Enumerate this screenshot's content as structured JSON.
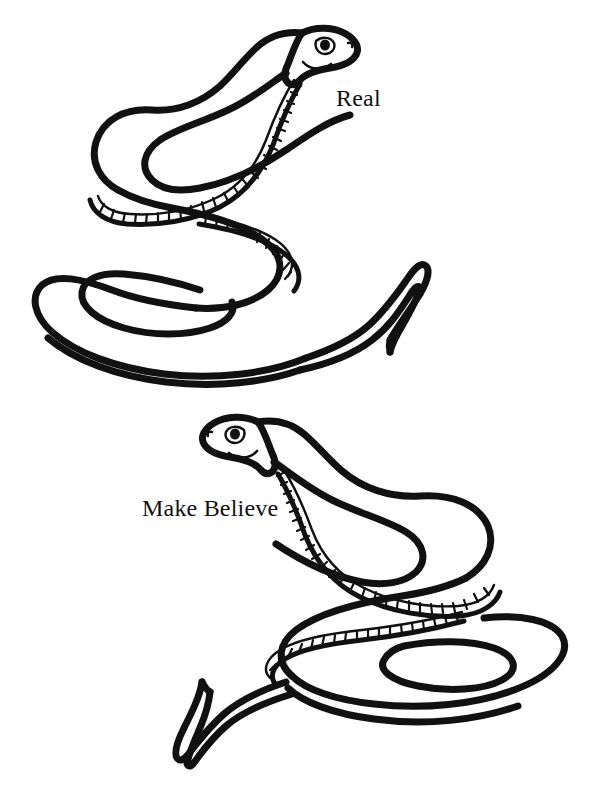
{
  "page": {
    "background_color": "#ffffff",
    "ink_color": "#111111",
    "width": 598,
    "height": 801,
    "style": "black and white line art coloring page"
  },
  "labels": {
    "real": "Real",
    "make_believe": "Make Believe"
  },
  "illustrations": [
    {
      "name": "real-snake",
      "label": "Real",
      "description": "Snake drawn in outline with head at upper right facing right, body winding in a large S-curve to the left, looping under itself and ending in a tapered tail at the right.",
      "head_direction": "right",
      "features": [
        "eye",
        "pupil",
        "nostril",
        "smiling-mouth",
        "belly-scale-band",
        "tapered-tail",
        "body-loop"
      ]
    },
    {
      "name": "make-believe-snake",
      "label": "Make Believe",
      "description": "Snake drawn in outline with head at upper left facing left, body winding in a large S-curve to the right, coiling into a loop at lower right and ending in a tapered tail pointing up-left.",
      "head_direction": "left",
      "features": [
        "eye",
        "pupil",
        "nostril",
        "smiling-mouth",
        "belly-scale-band",
        "tapered-tail",
        "body-coil"
      ]
    }
  ]
}
